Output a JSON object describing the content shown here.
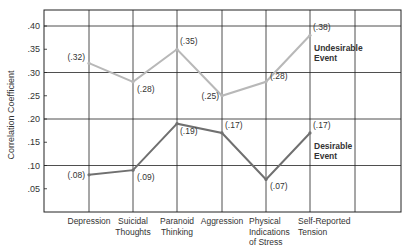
{
  "chart_data": {
    "type": "line",
    "title": "",
    "xlabel": "",
    "ylabel": "Correlation Coefficient",
    "ylim": [
      0,
      0.43
    ],
    "yticks": [
      ".05",
      ".10",
      ".15",
      ".20",
      ".25",
      ".30",
      ".35",
      ".40"
    ],
    "grid": true,
    "categories": [
      [
        "Depression"
      ],
      [
        "Suicidal",
        "Thoughts"
      ],
      [
        "Paranoid",
        "Thinking"
      ],
      [
        "Aggression"
      ],
      [
        "Physical",
        "Indications",
        "of Stress"
      ],
      [
        "Self-Reported",
        "Tension"
      ]
    ],
    "series": [
      {
        "name": "Undesirable Event",
        "label_lines": [
          "Undesirable",
          "Event"
        ],
        "color": "#b8b8b8",
        "values": [
          0.32,
          0.28,
          0.35,
          0.25,
          0.28,
          0.38
        ],
        "value_labels": [
          "(.32)",
          "(.28)",
          "(.35)",
          "(.25)",
          "(.28)",
          "(.38)"
        ]
      },
      {
        "name": "Desirable Event",
        "label_lines": [
          "Desirable",
          "Event"
        ],
        "color": "#707070",
        "values": [
          0.08,
          0.09,
          0.19,
          0.17,
          0.07,
          0.17
        ],
        "value_labels": [
          "(.08)",
          "(.09)",
          "(.19)",
          "(.17)",
          "(.07)",
          "(.17)"
        ]
      }
    ]
  }
}
